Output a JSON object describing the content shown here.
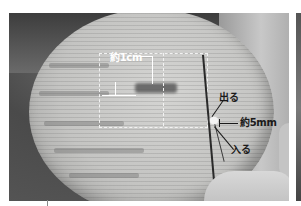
{
  "figure": {
    "annotations": {
      "width_label": "約1cm",
      "out_label": "出る",
      "stitch_spacing_label": "約5mm",
      "in_label": "入る"
    },
    "colors": {
      "annotation_light": "#ffffff",
      "annotation_dark": "#1a1a1a",
      "dashed_guide": "#f2f2f2"
    }
  }
}
